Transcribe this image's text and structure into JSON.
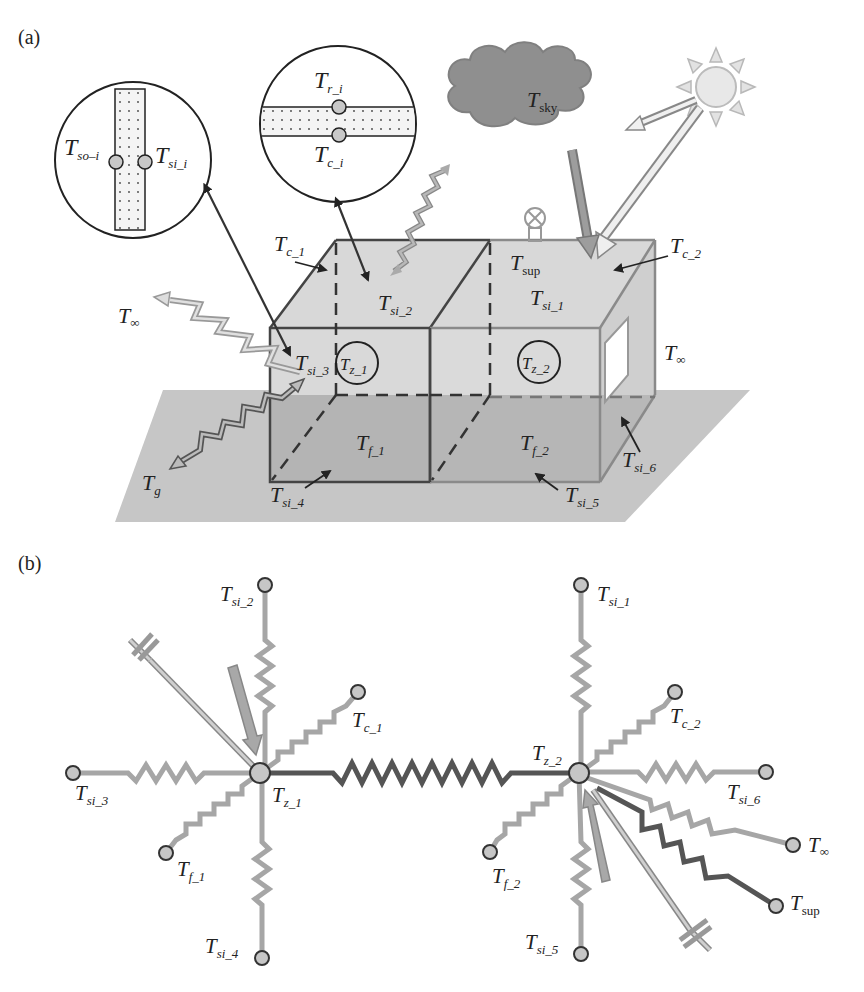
{
  "figure": {
    "panel_a_label": "(a)",
    "panel_b_label": "(b)"
  },
  "panel_a": {
    "insets": {
      "wall": {
        "left_node": {
          "T": "T",
          "sub": "so–i"
        },
        "right_node": {
          "T": "T",
          "sub": "si_i"
        }
      },
      "roof": {
        "top_node": {
          "T": "T",
          "sub": "r_i"
        },
        "bottom_node": {
          "T": "T",
          "sub": "c_i"
        }
      }
    },
    "sky": {
      "T": "T",
      "sub": "sky"
    },
    "labels": {
      "tc1": {
        "T": "T",
        "sub": "c_1"
      },
      "tc2": {
        "T": "T",
        "sub": "c_2"
      },
      "tsi2": {
        "T": "T",
        "sub": "si_2"
      },
      "tsi1": {
        "T": "T",
        "sub": "si_1"
      },
      "tsup": {
        "T": "T",
        "sub": "sup"
      },
      "tinf_left": {
        "T": "T",
        "sub": "∞"
      },
      "tinf_right": {
        "T": "T",
        "sub": "∞"
      },
      "tsi3": {
        "T": "T",
        "sub": "si_3"
      },
      "tz1": {
        "T": "T",
        "sub": "z_1"
      },
      "tz2": {
        "T": "T",
        "sub": "z_2"
      },
      "tf1": {
        "T": "T",
        "sub": "f_1"
      },
      "tf2": {
        "T": "T",
        "sub": "f_2"
      },
      "tg": {
        "T": "T",
        "sub": "g"
      },
      "tsi4": {
        "T": "T",
        "sub": "si_4"
      },
      "tsi5": {
        "T": "T",
        "sub": "si_5"
      },
      "tsi6": {
        "T": "T",
        "sub": "si_6"
      }
    }
  },
  "panel_b": {
    "zone1": {
      "center": {
        "T": "T",
        "sub": "z_1"
      },
      "nodes": [
        {
          "T": "T",
          "sub": "si_2"
        },
        {
          "T": "T",
          "sub": "c_1"
        },
        {
          "T": "T",
          "sub": "si_3"
        },
        {
          "T": "T",
          "sub": "f_1"
        },
        {
          "T": "T",
          "sub": "si_4"
        }
      ]
    },
    "zone2": {
      "center": {
        "T": "T",
        "sub": "z_2"
      },
      "nodes": [
        {
          "T": "T",
          "sub": "si_1"
        },
        {
          "T": "T",
          "sub": "c_2"
        },
        {
          "T": "T",
          "sub": "si_6"
        },
        {
          "T": "T",
          "sub": "∞"
        },
        {
          "T": "T",
          "sub": "sup"
        },
        {
          "T": "T",
          "sub": "f_2"
        },
        {
          "T": "T",
          "sub": "si_5"
        }
      ]
    }
  },
  "colors": {
    "ground": "#c4c4c4",
    "box_light": "#d6d6d6",
    "box_dark": "#b2b2b2",
    "cloud": "#8e8e8e",
    "resistor_light": "#a8a8a8",
    "resistor_dark": "#555555",
    "node_fill": "#c8c8c8",
    "sun": "#e6e6e6"
  }
}
